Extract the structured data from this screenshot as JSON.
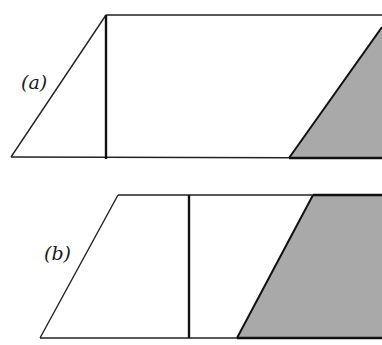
{
  "figure": {
    "panels": [
      {
        "id": "a",
        "label": "(a)",
        "description": "Parallelogram (unshaded left part) with vertical line and shaded triangular region at right",
        "colors": {
          "line": "#111111",
          "shade": "#a9a9a9",
          "fill": "#ffffff"
        }
      },
      {
        "id": "b",
        "label": "(b)",
        "description": "Parallelogram with vertical line and larger shaded trapezoidal region at right",
        "colors": {
          "line": "#111111",
          "shade": "#a9a9a9",
          "fill": "#ffffff"
        }
      }
    ]
  }
}
